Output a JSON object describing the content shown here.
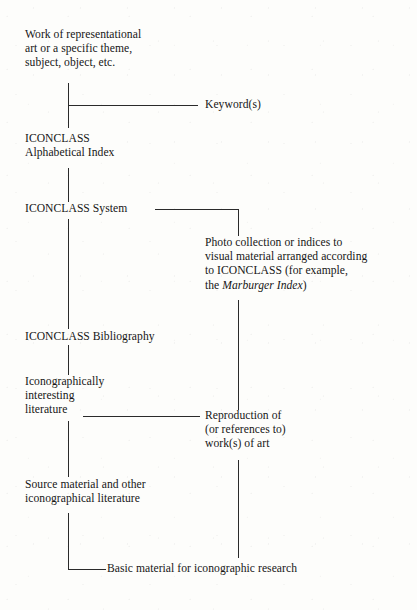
{
  "diagram": {
    "background_color": "#fdfdfb",
    "line_color": "#2a2a2a",
    "nodes": {
      "work_of_art": "Work of representational\nart or a specific theme,\nsubject, object, etc.",
      "keywords": "Keyword(s)",
      "alphabetical_index": "ICONCLASS\nAlphabetical Index",
      "iconclass_system": "ICONCLASS System",
      "photo_collection_line1": "Photo collection or indices to",
      "photo_collection_line2": "visual material arranged according",
      "photo_collection_line3": "to ICONCLASS (for example,",
      "photo_collection_line4_pre": "the ",
      "photo_collection_line4_italic": "Marburger Index",
      "photo_collection_line4_post": ")",
      "bibliography": "ICONCLASS Bibliography",
      "iconographic_literature": "Iconographically\ninteresting\nliterature",
      "reproduction": "Reproduction of\n(or references to)\nwork(s)  of art",
      "source_material": "Source material and other\niconographical literature",
      "basic_material": "Basic material for iconographic research"
    }
  }
}
